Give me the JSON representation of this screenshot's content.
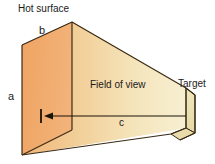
{
  "figure": {
    "type": "technical-diagram",
    "width": 215,
    "height": 164,
    "background_color": "#FFFFFF",
    "labels": {
      "hot_surface": "Hot surface",
      "side_a": "a",
      "side_b": "b",
      "distance_c": "c",
      "field_of_view": "Field of view",
      "target": "Target"
    },
    "colors": {
      "left_face": "#F0A868",
      "top_face": "#EFA96B",
      "cone_near": "#F3BE84",
      "cone_mid": "#F2D6A0",
      "cone_far": "#F6ECCA",
      "target_face": "#EDE3B8",
      "outline": "#3A2A14"
    },
    "geometry": {
      "apex": [
        72,
        22
      ],
      "left_top": [
        22,
        45
      ],
      "left_bottom": [
        22,
        155
      ],
      "target_top": [
        186,
        88
      ],
      "target_bottom": [
        186,
        128
      ],
      "arrow_from": [
        176,
        116
      ],
      "arrow_to": [
        44,
        116
      ],
      "tick_x": 41
    }
  }
}
